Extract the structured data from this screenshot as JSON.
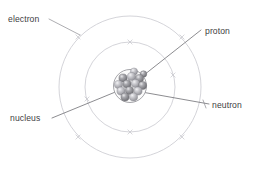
{
  "diagram": {
    "background_color": "#ffffff",
    "labels": {
      "electron": "electron",
      "proton": "proton",
      "neutron": "neutron",
      "nucleus": "nucleus"
    },
    "colors": {
      "orbit_stroke": "#c9c9cf",
      "leader_stroke": "#6f6f74",
      "label_text": "#3e3e43",
      "nucleus_outline": "#8f8f94",
      "proton_sphere": "#8d8d92",
      "neutron_sphere": "#b9b9be"
    },
    "orbits": [
      {
        "name": "outer-orbit",
        "cx": 130,
        "cy": 87,
        "r": 71
      },
      {
        "name": "inner-orbit",
        "cx": 130,
        "cy": 87,
        "r": 45
      }
    ],
    "nucleus": {
      "cx": 130,
      "cy": 86,
      "r": 16.5
    },
    "electron_markers": [
      {
        "orbit": "inner",
        "x": 130,
        "y": 42
      },
      {
        "orbit": "inner",
        "x": 130,
        "y": 132
      },
      {
        "orbit": "inner",
        "x": 87,
        "y": 99
      },
      {
        "orbit": "inner",
        "x": 173,
        "y": 75
      },
      {
        "orbit": "outer",
        "x": 78,
        "y": 37
      },
      {
        "orbit": "outer",
        "x": 182,
        "y": 37
      },
      {
        "orbit": "outer",
        "x": 78,
        "y": 137
      },
      {
        "orbit": "outer",
        "x": 182,
        "y": 137
      },
      {
        "orbit": "outer",
        "x": 205,
        "y": 103
      }
    ],
    "nucleons": [
      {
        "type": "proton",
        "x": 123.0,
        "y": 78.0,
        "r": 4.1
      },
      {
        "type": "neutron",
        "x": 131.5,
        "y": 76.5,
        "r": 4.1
      },
      {
        "type": "proton",
        "x": 139.5,
        "y": 78.5,
        "r": 4.1
      },
      {
        "type": "neutron",
        "x": 118.5,
        "y": 84.5,
        "r": 4.1
      },
      {
        "type": "proton",
        "x": 127.0,
        "y": 84.0,
        "r": 4.1
      },
      {
        "type": "neutron",
        "x": 135.5,
        "y": 83.5,
        "r": 4.1
      },
      {
        "type": "proton",
        "x": 142.5,
        "y": 85.5,
        "r": 4.1
      },
      {
        "type": "neutron",
        "x": 121.0,
        "y": 91.0,
        "r": 4.1
      },
      {
        "type": "proton",
        "x": 129.5,
        "y": 90.5,
        "r": 4.1
      },
      {
        "type": "neutron",
        "x": 138.0,
        "y": 91.0,
        "r": 4.1
      },
      {
        "type": "proton",
        "x": 125.0,
        "y": 97.0,
        "r": 4.1
      },
      {
        "type": "neutron",
        "x": 133.5,
        "y": 97.0,
        "r": 4.1
      },
      {
        "type": "proton",
        "x": 134.0,
        "y": 71.5,
        "r": 3.6
      },
      {
        "type": "neutron",
        "x": 143.5,
        "y": 74.0,
        "r": 3.3
      }
    ],
    "leader_lines": [
      {
        "name": "electron-leader",
        "from": [
          49,
          19
        ],
        "to": [
          80,
          35
        ]
      },
      {
        "name": "proton-leader",
        "from": [
          201,
          30
        ],
        "to": [
          130,
          86
        ]
      },
      {
        "name": "nucleus-leader",
        "from": [
          52,
          118
        ],
        "to": [
          130,
          86
        ]
      },
      {
        "name": "neutron-leader",
        "from": [
          209,
          104
        ],
        "to": [
          136,
          91
        ]
      }
    ]
  }
}
